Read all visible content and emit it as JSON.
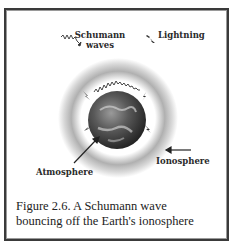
{
  "figure": {
    "labels": {
      "schumann_line1": "Schumann",
      "schumann_line2": "waves",
      "lightning": "Lightning",
      "atmosphere": "Atmosphere",
      "ionosphere": "Ionosphere"
    },
    "caption_line1": "Figure 2.6. A Schumann wave",
    "caption_line2": "bouncing off the Earth's ionosphere",
    "icons": [
      "zigzag-wave-icon",
      "lightning-bolt-icon",
      "earth-globe",
      "arrow-icon"
    ],
    "colors": {
      "border": "#3a3a3a",
      "halo": "#b8b8b8",
      "text": "#2a2a2a"
    }
  }
}
